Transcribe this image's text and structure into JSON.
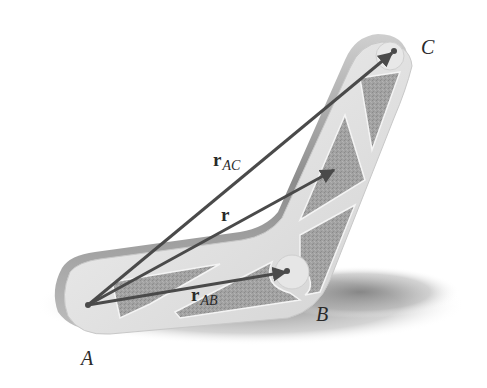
{
  "figure": {
    "points": {
      "A": {
        "label": "A",
        "x": 88,
        "y": 305
      },
      "B": {
        "label": "B",
        "x": 287,
        "y": 271
      },
      "C": {
        "label": "C",
        "x": 394,
        "y": 51
      }
    },
    "vectors": [
      {
        "name": "r_AC",
        "bold": "r",
        "subscript": "AC",
        "from": "A",
        "to": "C"
      },
      {
        "name": "r",
        "bold": "r",
        "subscript": "",
        "from": "A",
        "to": [
          335,
          170
        ]
      },
      {
        "name": "r_AB",
        "bold": "r",
        "subscript": "AB",
        "from": "A",
        "to": "B"
      }
    ],
    "labels": {
      "point_A": "A",
      "point_B": "B",
      "point_C": "C",
      "vec_AC_main": "r",
      "vec_AC_sub": "AC",
      "vec_r_main": "r",
      "vec_AB_main": "r",
      "vec_AB_sub": "AB"
    },
    "colors": {
      "background": "#ffffff",
      "member_face": "#e4e4e4",
      "member_edge": "#b8b8b8",
      "cutout_fill": "#9a9a9a",
      "shadow": "#8a8a8a",
      "arrow": "#4a4a4a",
      "text": "#2a2a2a"
    }
  }
}
